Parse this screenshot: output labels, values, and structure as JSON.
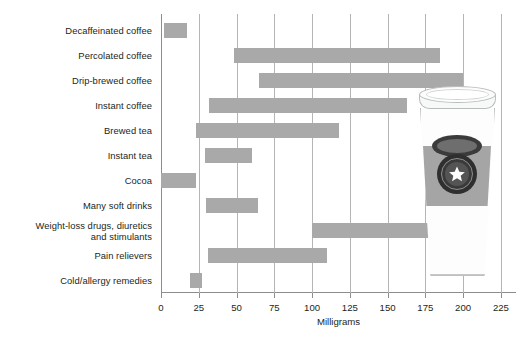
{
  "chart_data": {
    "type": "bar",
    "orientation": "horizontal",
    "subtype": "range-bar",
    "title": "",
    "xlabel": "Milligrams",
    "ylabel": "",
    "xlim": [
      0,
      235
    ],
    "xticks": [
      0,
      25,
      50,
      75,
      100,
      125,
      150,
      175,
      200,
      225
    ],
    "xtick_labels": [
      "0",
      "25",
      "50",
      "75",
      "100",
      "125",
      "150",
      "175",
      "200",
      "225"
    ],
    "grid": "vertical",
    "legend": "none",
    "bar_color": "#a9a9a9",
    "categories": [
      "Decaffeinated coffee",
      "Percolated coffee",
      "Drip-brewed coffee",
      "Instant coffee",
      "Brewed tea",
      "Instant tea",
      "Cocoa",
      "Many soft drinks",
      "Weight-loss drugs, diuretics\nand stimulants",
      "Pain relievers",
      "Cold/allergy remedies"
    ],
    "ranges": [
      {
        "category": "Decaffeinated coffee",
        "low": 2,
        "high": 17
      },
      {
        "category": "Percolated coffee",
        "low": 48,
        "high": 185
      },
      {
        "category": "Drip-brewed coffee",
        "low": 65,
        "high": 200
      },
      {
        "category": "Instant coffee",
        "low": 32,
        "high": 163
      },
      {
        "category": "Brewed tea",
        "low": 23,
        "high": 118
      },
      {
        "category": "Instant tea",
        "low": 29,
        "high": 60
      },
      {
        "category": "Cocoa",
        "low": 0,
        "high": 23
      },
      {
        "category": "Many soft drinks",
        "low": 30,
        "high": 64
      },
      {
        "category": "Weight-loss drugs, diuretics and stimulants",
        "low": 100,
        "high": 200
      },
      {
        "category": "Pain relievers",
        "low": 31,
        "high": 110
      },
      {
        "category": "Cold/allergy remedies",
        "low": 19,
        "high": 27
      }
    ]
  },
  "illustration": {
    "name": "takeaway-coffee-cup",
    "logo": "star-emblem"
  }
}
